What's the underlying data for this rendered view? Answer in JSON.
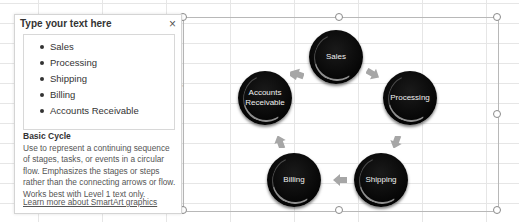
{
  "text_pane": {
    "title": "Type your text here",
    "close_label": "×",
    "items": [
      "Sales",
      "Processing",
      "Shipping",
      "Billing",
      "Accounts Receivable"
    ],
    "layout_name": "Basic Cycle",
    "layout_description": "Use to represent a continuing sequence of stages, tasks, or events in a circular flow. Emphasizes the stages or steps rather than the connecting arrows or flow. Works best with Level 1 text only.",
    "learn_more_link": "Learn more about SmartArt graphics"
  },
  "diagram": {
    "layout": "Basic Cycle",
    "nodes": [
      {
        "label_line1": "Sales",
        "label_line2": ""
      },
      {
        "label_line1": "Processing",
        "label_line2": ""
      },
      {
        "label_line1": "Shipping",
        "label_line2": ""
      },
      {
        "label_line1": "Billing",
        "label_line2": ""
      },
      {
        "label_line1": "Accounts",
        "label_line2": "Receivable"
      }
    ],
    "node_color": "#000000",
    "arrow_color": "#a6a6a6"
  },
  "pane_expander_icon": "‹"
}
